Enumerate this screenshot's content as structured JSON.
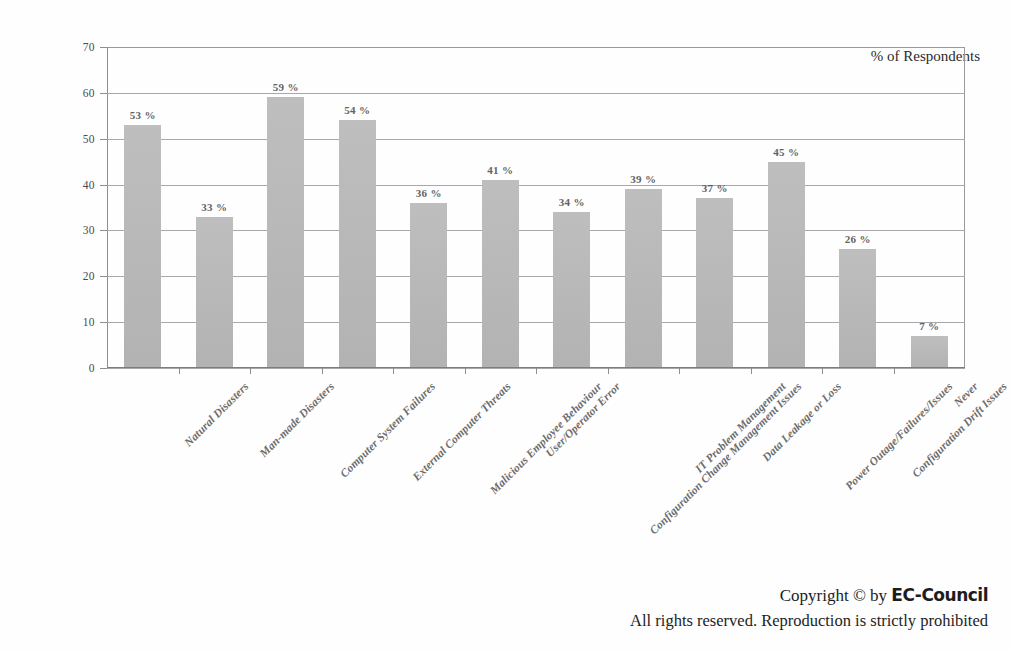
{
  "chart_data": {
    "type": "bar",
    "title": "",
    "subtitle": "",
    "xlabel": "",
    "ylabel": "",
    "ylim": [
      0,
      70
    ],
    "yticks": [
      0,
      10,
      20,
      30,
      40,
      50,
      60,
      70
    ],
    "grid": true,
    "legend_position": "top-right",
    "legend_label": "% of Respondents",
    "value_suffix": "%",
    "bar_color": "#b9b9b9",
    "categories": [
      "Natural Disasters",
      "Man-made Disasters",
      "Computer System Failures",
      "External Computer Threats",
      "Malicious Employee Behaviour",
      "User/Operator Error",
      "Configuration Change Management Issues",
      "IT Problem Management",
      "Data Leakage or Loss",
      "Power Outage/Failures/Issues",
      "Configuration Drift Issues",
      "Never"
    ],
    "values": [
      53,
      33,
      59,
      54,
      36,
      41,
      34,
      39,
      37,
      45,
      26,
      7
    ],
    "data_labels": [
      "53 %",
      "33 %",
      "59 %",
      "54 %",
      "36 %",
      "41 %",
      "34 %",
      "39 %",
      "37 %",
      "45 %",
      "26 %",
      "7 %"
    ],
    "ytick_labels": [
      "0",
      "10",
      "20",
      "30",
      "40",
      "50",
      "60",
      "70"
    ]
  },
  "legend": {
    "label": "% of Respondents"
  },
  "footer": {
    "copyright_prefix": "Copyright © by ",
    "brand": "EC-Council",
    "rights": "All rights reserved. Reproduction is strictly prohibited"
  }
}
